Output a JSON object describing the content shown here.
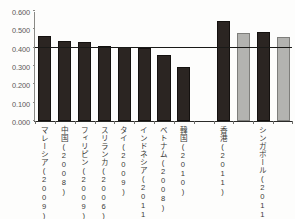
{
  "chart_data": {
    "type": "bar",
    "title": "",
    "subtitle": "",
    "xlabel": "",
    "ylabel": "",
    "ylim": [
      0.0,
      0.6
    ],
    "grid": false,
    "legend": "none",
    "y_ticks": [
      "0.600",
      "0.500",
      "0.400",
      "0.300",
      "0.200",
      "0.100",
      "0.000"
    ],
    "y_tick_values": [
      0.6,
      0.5,
      0.4,
      0.3,
      0.2,
      0.1,
      0.0
    ],
    "reference_line": {
      "value": 0.4,
      "label": ""
    },
    "categories": [
      "マレーシア(2009)",
      "中国(2008)",
      "フィリピン(2009)",
      "スリランカ(2006)",
      "タイ(2009)",
      "インドネシア(2011)",
      "ベトナム(2008)",
      "韓国(2010)",
      "",
      "香港(2011)",
      "",
      "シンガポール(2011)",
      ""
    ],
    "values": [
      0.463,
      0.437,
      0.433,
      0.407,
      0.405,
      0.398,
      0.362,
      0.293,
      null,
      0.545,
      0.478,
      0.487,
      0.457
    ],
    "bar_colors": [
      "#2b2522",
      "#2b2522",
      "#2b2522",
      "#2b2522",
      "#2b2522",
      "#2b2522",
      "#2b2522",
      "#2b2522",
      null,
      "#2b2522",
      "#b3b3b0",
      "#2b2522",
      "#b3b3b0"
    ],
    "series": [
      {
        "name": "values",
        "values": [
          0.463,
          0.437,
          0.433,
          0.407,
          0.405,
          0.398,
          0.362,
          0.293,
          null,
          0.545,
          0.478,
          0.487,
          0.457
        ]
      }
    ],
    "colors": {
      "dark_bar": "#2b2522",
      "gray_bar": "#b3b3b0",
      "axis": "#2b2b29",
      "reference_line": "#1a1a18",
      "background": "#fdfdfc"
    }
  }
}
